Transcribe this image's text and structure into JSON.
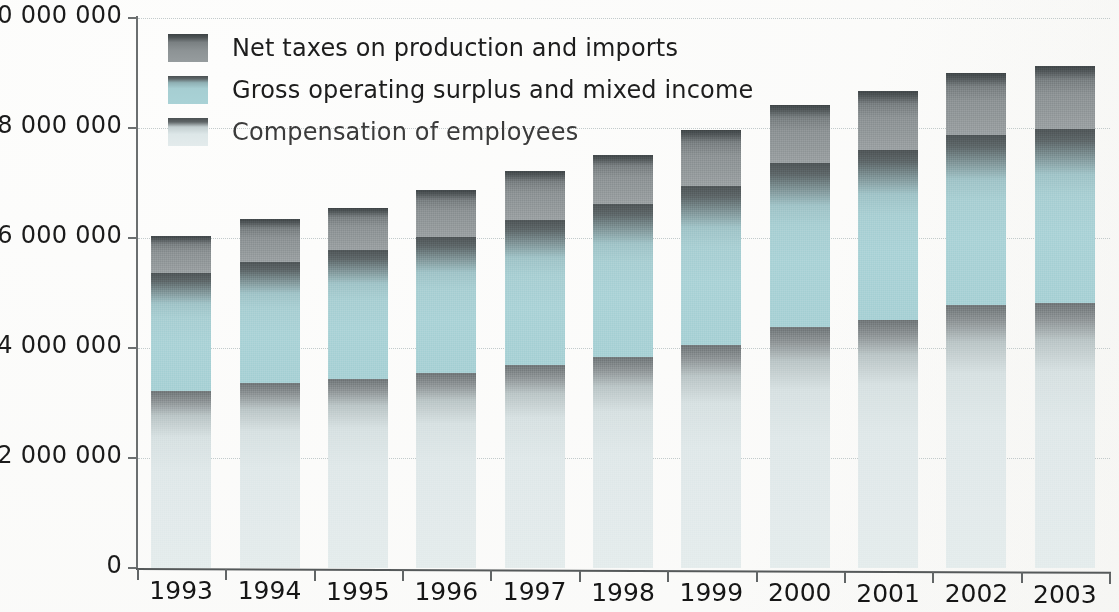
{
  "chart_data": {
    "type": "bar",
    "stacked": true,
    "title": "",
    "subtitle": "",
    "xlabel": "",
    "ylabel": "",
    "grid": true,
    "legend_position": "top-left",
    "categories": [
      "1993",
      "1994",
      "1995",
      "1996",
      "1997",
      "1998",
      "1999",
      "2000",
      "2001",
      "2002",
      "2003"
    ],
    "ylim": [
      0,
      10000000
    ],
    "yticks": [
      0,
      2000000,
      4000000,
      6000000,
      8000000,
      10000000
    ],
    "ytick_labels": [
      "0",
      "2 000 000",
      "4 000 000",
      "6 000 000",
      "8 000 000",
      "10 000 000"
    ],
    "series": [
      {
        "name": "Compensation of employees",
        "color": "#e0e9ea",
        "values": [
          3210000,
          3360000,
          3440000,
          3550000,
          3690000,
          3840000,
          4050000,
          4380000,
          4510000,
          4780000,
          4820000
        ]
      },
      {
        "name": "Gross operating surplus and mixed income",
        "color": "#a7d0d4",
        "values": [
          2150000,
          2200000,
          2340000,
          2470000,
          2640000,
          2780000,
          2900000,
          2980000,
          3090000,
          3090000,
          3160000
        ]
      },
      {
        "name": "Net taxes on production and imports",
        "color": "#8d9395",
        "values": [
          680000,
          790000,
          770000,
          850000,
          890000,
          890000,
          1010000,
          1060000,
          1070000,
          1130000,
          1150000
        ]
      }
    ],
    "totals": [
      6040000,
      6350000,
      6550000,
      6870000,
      7220000,
      7510000,
      7960000,
      8420000,
      8670000,
      9000000,
      9130000
    ]
  },
  "legend": {
    "items": [
      {
        "label": "Net taxes on production and imports",
        "swatch": "tax"
      },
      {
        "label": "Gross operating surplus and mixed income",
        "swatch": "gos"
      },
      {
        "label": "Compensation of employees",
        "swatch": "comp"
      }
    ]
  }
}
